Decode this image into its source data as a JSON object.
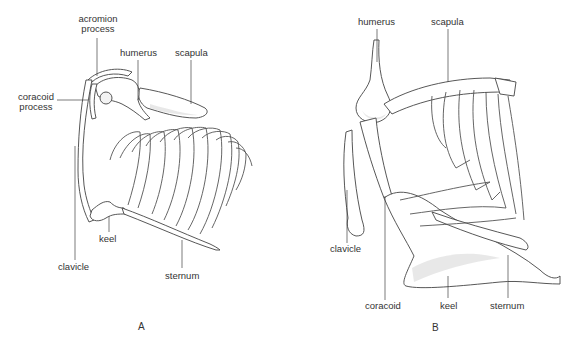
{
  "figure": {
    "panels": [
      {
        "id": "A",
        "letter": "A",
        "labels": {
          "acromion_process": [
            "acromion",
            "process"
          ],
          "coracoid_process": [
            "coracoid",
            "process"
          ],
          "humerus": "humerus",
          "scapula": "scapula",
          "keel": "keel",
          "clavicle": "clavicle",
          "sternum": "sternum"
        }
      },
      {
        "id": "B",
        "letter": "B",
        "labels": {
          "humerus": "humerus",
          "scapula": "scapula",
          "clavicle": "clavicle",
          "coracoid": "coracoid",
          "keel": "keel",
          "sternum": "sternum"
        }
      }
    ]
  }
}
